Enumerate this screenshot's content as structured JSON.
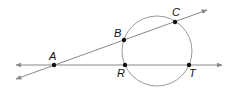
{
  "diagram": {
    "circle": {
      "cx": 157,
      "cy": 51,
      "r": 35,
      "stroke": "#999999"
    },
    "lines": [
      {
        "name": "secant-ABC",
        "x1": 16,
        "y1": 79,
        "x2": 207,
        "y2": 10,
        "stroke": "#888888"
      },
      {
        "name": "secant-ART",
        "x1": 16,
        "y1": 65,
        "x2": 222,
        "y2": 65,
        "stroke": "#888888"
      }
    ],
    "points": [
      {
        "label": "A",
        "x": 54,
        "y": 65,
        "lx": 49,
        "ly": 60
      },
      {
        "label": "B",
        "x": 124,
        "y": 40,
        "lx": 114,
        "ly": 37
      },
      {
        "label": "C",
        "x": 175,
        "y": 22,
        "lx": 172,
        "ly": 16
      },
      {
        "label": "R",
        "x": 125,
        "y": 65,
        "lx": 117,
        "ly": 77
      },
      {
        "label": "T",
        "x": 189,
        "y": 65,
        "lx": 189,
        "ly": 77
      }
    ]
  }
}
